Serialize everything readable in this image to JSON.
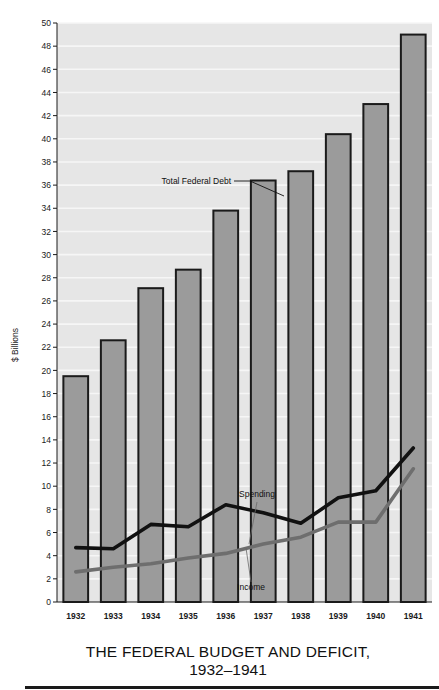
{
  "chart_data": {
    "type": "bar",
    "title": "THE FEDERAL BUDGET AND DEFICIT,",
    "subtitle": "1932–1941",
    "xlabel": "",
    "ylabel": "$ Billions",
    "categories": [
      "1932",
      "1933",
      "1934",
      "1935",
      "1936",
      "1937",
      "1938",
      "1939",
      "1940",
      "1941"
    ],
    "ylim": [
      0,
      50
    ],
    "ytick_step": 2,
    "yticks": [
      0,
      2,
      4,
      6,
      8,
      10,
      12,
      14,
      16,
      18,
      20,
      22,
      24,
      26,
      28,
      30,
      32,
      34,
      36,
      38,
      40,
      42,
      44,
      46,
      48,
      50
    ],
    "grid": "horizontal",
    "legend_position": "inline-annotations",
    "bars": {
      "name": "Total Federal Debt",
      "values": [
        19.5,
        22.6,
        27.1,
        28.7,
        33.8,
        36.4,
        37.2,
        40.4,
        43.0,
        49.0
      ],
      "fill_color": "#9b9b9b",
      "edge_color": "#1a1a1a"
    },
    "series": [
      {
        "name": "Spending",
        "values": [
          4.7,
          4.6,
          6.7,
          6.5,
          8.4,
          7.7,
          6.8,
          9.0,
          9.6,
          13.3
        ],
        "color": "#111111",
        "style": "line"
      },
      {
        "name": "Income",
        "values": [
          2.6,
          3.0,
          3.3,
          3.8,
          4.2,
          5.0,
          5.6,
          6.9,
          6.9,
          11.5
        ],
        "color": "#6e6e6e",
        "style": "line"
      }
    ],
    "annotations": [
      {
        "text": "Total Federal Debt",
        "target": "bars",
        "leader": true
      },
      {
        "text": "Spending",
        "target": "Spending",
        "leader": true
      },
      {
        "text": "Income",
        "target": "Income",
        "leader": true
      }
    ],
    "plot_background": "#e6e6e6"
  },
  "colors": {
    "bar_fill": "#9b9b9b",
    "bar_edge": "#1a1a1a",
    "spending_line": "#111111",
    "income_line": "#6e6e6e",
    "plot_bg": "#e6e6e6",
    "grid": "#f6f6f6",
    "page_bg": "#ffffff",
    "rule": "#1a1a1a"
  },
  "labels": {
    "y_axis_title": "$ Billions",
    "annotation_debt": "Total Federal Debt",
    "annotation_spending": "Spending",
    "annotation_income": "Income",
    "title": "THE FEDERAL BUDGET AND DEFICIT,",
    "subtitle": "1932–1941"
  }
}
